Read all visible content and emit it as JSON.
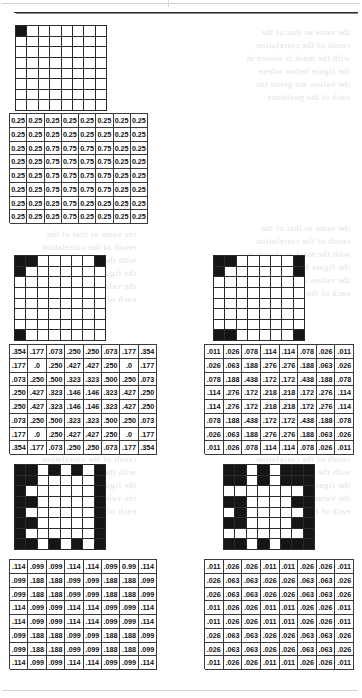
{
  "page": {
    "ghost_text_blocks": [
      "the same as that of the\nresult of the correlation\nwith the mask is shown in\nthe figure below where\nthe values are given for\neach of the positions"
    ]
  },
  "figures": [
    {
      "id": "figure-1",
      "name": "bitmap-1",
      "rows": 8,
      "cols": 8,
      "description": "single black cell at top-left corner",
      "cells": [
        [
          1,
          0,
          0,
          0,
          0,
          0,
          0,
          0
        ],
        [
          0,
          0,
          0,
          0,
          0,
          0,
          0,
          0
        ],
        [
          0,
          0,
          0,
          0,
          0,
          0,
          0,
          0
        ],
        [
          0,
          0,
          0,
          0,
          0,
          0,
          0,
          0
        ],
        [
          0,
          0,
          0,
          0,
          0,
          0,
          0,
          0
        ],
        [
          0,
          0,
          0,
          0,
          0,
          0,
          0,
          0
        ],
        [
          0,
          0,
          0,
          0,
          0,
          0,
          0,
          0
        ],
        [
          0,
          0,
          0,
          0,
          0,
          0,
          0,
          0
        ]
      ]
    },
    {
      "id": "figure-2",
      "name": "bitmap-2",
      "rows": 8,
      "cols": 8,
      "description": "black cells at three corners plus inner neighbours",
      "cells": [
        [
          1,
          1,
          0,
          0,
          0,
          0,
          0,
          1
        ],
        [
          1,
          0,
          0,
          0,
          0,
          0,
          0,
          0
        ],
        [
          0,
          0,
          0,
          0,
          0,
          0,
          0,
          0
        ],
        [
          0,
          0,
          0,
          0,
          0,
          0,
          0,
          0
        ],
        [
          0,
          0,
          0,
          0,
          0,
          0,
          0,
          0
        ],
        [
          0,
          0,
          0,
          0,
          0,
          0,
          0,
          0
        ],
        [
          0,
          0,
          0,
          0,
          0,
          0,
          0,
          0
        ],
        [
          1,
          0,
          0,
          0,
          0,
          0,
          0,
          0
        ]
      ]
    },
    {
      "id": "figure-3",
      "name": "bitmap-3",
      "rows": 8,
      "cols": 8,
      "description": "alternating black cells along top row and left column",
      "cells": [
        [
          1,
          1,
          0,
          1,
          0,
          1,
          0,
          1
        ],
        [
          1,
          1,
          0,
          0,
          0,
          0,
          0,
          1
        ],
        [
          1,
          0,
          0,
          0,
          0,
          0,
          0,
          1
        ],
        [
          1,
          1,
          0,
          0,
          0,
          0,
          0,
          1
        ],
        [
          1,
          0,
          0,
          0,
          0,
          0,
          0,
          1
        ],
        [
          1,
          1,
          0,
          0,
          0,
          0,
          0,
          1
        ],
        [
          1,
          0,
          0,
          0,
          0,
          0,
          0,
          1
        ],
        [
          1,
          1,
          0,
          1,
          0,
          1,
          0,
          1
        ]
      ]
    },
    {
      "id": "figure-4",
      "name": "bitmap-4",
      "rows": 8,
      "cols": 8,
      "description": "black blocks at top-left, top-right and bottom-left corners",
      "cells": [
        [
          1,
          1,
          0,
          0,
          0,
          0,
          0,
          1
        ],
        [
          1,
          0,
          0,
          0,
          0,
          0,
          0,
          1
        ],
        [
          0,
          0,
          0,
          0,
          0,
          0,
          0,
          0
        ],
        [
          0,
          0,
          0,
          0,
          0,
          0,
          0,
          0
        ],
        [
          0,
          0,
          0,
          0,
          0,
          0,
          0,
          0
        ],
        [
          0,
          0,
          0,
          0,
          0,
          0,
          0,
          0
        ],
        [
          0,
          0,
          0,
          0,
          0,
          0,
          0,
          0
        ],
        [
          1,
          1,
          0,
          0,
          0,
          0,
          0,
          1
        ]
      ]
    },
    {
      "id": "figure-5",
      "name": "bitmap-5",
      "rows": 8,
      "cols": 8,
      "description": "checkerboard-like border pattern",
      "cells": [
        [
          1,
          1,
          0,
          1,
          0,
          1,
          1,
          1
        ],
        [
          1,
          1,
          0,
          1,
          0,
          1,
          1,
          1
        ],
        [
          0,
          0,
          0,
          0,
          0,
          0,
          0,
          1
        ],
        [
          1,
          1,
          0,
          0,
          0,
          0,
          1,
          1
        ],
        [
          0,
          1,
          0,
          0,
          0,
          0,
          0,
          1
        ],
        [
          1,
          1,
          0,
          0,
          0,
          0,
          1,
          1
        ],
        [
          0,
          0,
          0,
          0,
          0,
          0,
          0,
          1
        ],
        [
          1,
          1,
          0,
          1,
          0,
          1,
          1,
          1
        ]
      ]
    }
  ],
  "matrices": [
    {
      "id": "matrix-1",
      "name": "coefficient-matrix-1",
      "rows": [
        [
          "0.25",
          "0.25",
          "0.25",
          "0.25",
          "0.25",
          "0.25",
          "0.25",
          "0.25"
        ],
        [
          "0.25",
          "0.25",
          "0.25",
          "0.25",
          "0.25",
          "0.25",
          "0.25",
          "0.25"
        ],
        [
          "0.25",
          "0.25",
          "0.75",
          "0.75",
          "0.75",
          "0.75",
          "0.25",
          "0.25"
        ],
        [
          "0.25",
          "0.25",
          "0.75",
          "0.75",
          "0.75",
          "0.75",
          "0.25",
          "0.25"
        ],
        [
          "0.25",
          "0.25",
          "0.75",
          "0.75",
          "0.75",
          "0.75",
          "0.25",
          "0.25"
        ],
        [
          "0.25",
          "0.25",
          "0.75",
          "0.75",
          "0.75",
          "0.75",
          "0.25",
          "0.25"
        ],
        [
          "0.25",
          "0.25",
          "0.25",
          "0.75",
          "0.25",
          "0.25",
          "0.25",
          "0.25"
        ],
        [
          "0.25",
          "0.25",
          "0.25",
          "0.75",
          "0.25",
          "0.25",
          "0.25",
          "0.25"
        ]
      ]
    },
    {
      "id": "matrix-2",
      "name": "coefficient-matrix-2",
      "rows": [
        [
          ".354",
          ".177",
          ".073",
          ".250",
          ".250",
          ".073",
          ".177",
          ".354"
        ],
        [
          ".177",
          ".0",
          ".250",
          ".427",
          ".427",
          ".250",
          ".0",
          ".177"
        ],
        [
          ".073",
          ".250",
          ".500",
          ".323",
          ".323",
          ".500",
          ".250",
          ".073"
        ],
        [
          ".250",
          ".427",
          ".323",
          ".146",
          ".146",
          ".323",
          ".427",
          ".250"
        ],
        [
          ".250",
          ".427",
          ".323",
          ".146",
          ".146",
          ".323",
          ".427",
          ".250"
        ],
        [
          ".073",
          ".250",
          ".500",
          ".323",
          ".323",
          ".500",
          ".250",
          ".073"
        ],
        [
          ".177",
          ".0",
          ".250",
          ".427",
          ".427",
          ".250",
          ".0",
          ".177"
        ],
        [
          ".354",
          ".177",
          ".073",
          ".250",
          ".250",
          ".073",
          ".177",
          ".354"
        ]
      ]
    },
    {
      "id": "matrix-3",
      "name": "coefficient-matrix-3",
      "rows": [
        [
          ".114",
          ".099",
          ".099",
          ".114",
          ".114",
          ".099",
          "0.99",
          ".114"
        ],
        [
          ".099",
          ".188",
          ".188",
          ".099",
          ".099",
          ".188",
          ".188",
          ".099"
        ],
        [
          ".099",
          ".188",
          ".188",
          ".099",
          ".099",
          ".188",
          ".188",
          ".099"
        ],
        [
          ".114",
          ".099",
          ".099",
          ".114",
          ".114",
          ".099",
          ".099",
          ".114"
        ],
        [
          ".114",
          ".099",
          ".099",
          ".114",
          ".114",
          ".099",
          ".099",
          ".114"
        ],
        [
          ".099",
          ".188",
          ".188",
          ".099",
          ".099",
          ".188",
          ".188",
          ".099"
        ],
        [
          ".099",
          ".188",
          ".188",
          ".099",
          ".099",
          ".188",
          ".188",
          ".099"
        ],
        [
          ".114",
          ".099",
          ".099",
          ".114",
          ".114",
          ".099",
          ".099",
          ".114"
        ]
      ]
    },
    {
      "id": "matrix-4",
      "name": "coefficient-matrix-4",
      "rows": [
        [
          ".011",
          ".026",
          ".078",
          ".114",
          ".114",
          ".078",
          ".026",
          ".011"
        ],
        [
          ".026",
          ".063",
          ".188",
          ".276",
          ".276",
          ".188",
          ".063",
          ".026"
        ],
        [
          ".078",
          ".188",
          ".438",
          ".172",
          ".172",
          ".438",
          ".188",
          ".078"
        ],
        [
          ".114",
          ".276",
          ".172",
          ".218",
          ".218",
          ".172",
          ".276",
          ".114"
        ],
        [
          ".114",
          ".276",
          ".172",
          ".218",
          ".218",
          ".172",
          ".276",
          ".114"
        ],
        [
          ".078",
          ".188",
          ".438",
          ".172",
          ".172",
          ".438",
          ".188",
          ".078"
        ],
        [
          ".026",
          ".063",
          ".188",
          ".276",
          ".276",
          ".188",
          ".063",
          ".026"
        ],
        [
          ".011",
          ".026",
          ".078",
          ".114",
          ".114",
          ".078",
          ".026",
          ".011"
        ]
      ]
    },
    {
      "id": "matrix-5",
      "name": "coefficient-matrix-5",
      "rows": [
        [
          ".011",
          ".026",
          ".026",
          ".011",
          ".011",
          ".026",
          ".026",
          ".011"
        ],
        [
          ".026",
          ".063",
          ".063",
          ".026",
          ".026",
          ".063",
          ".063",
          ".026"
        ],
        [
          ".026",
          ".063",
          ".063",
          ".026",
          ".026",
          ".063",
          ".063",
          ".026"
        ],
        [
          ".011",
          ".026",
          ".026",
          ".011",
          ".011",
          ".026",
          ".026",
          ".011"
        ],
        [
          ".011",
          ".026",
          ".026",
          ".011",
          ".011",
          ".026",
          ".026",
          ".011"
        ],
        [
          ".026",
          ".063",
          ".063",
          ".026",
          ".026",
          ".063",
          ".063",
          ".026"
        ],
        [
          ".026",
          ".063",
          ".063",
          ".026",
          ".026",
          ".063",
          ".063",
          ".026"
        ],
        [
          ".011",
          ".026",
          ".026",
          ".011",
          ".011",
          ".026",
          ".026",
          ".011"
        ]
      ]
    }
  ],
  "colors": {
    "ink": "#151515",
    "paper": "#ffffff",
    "grid_line": "#3a3a3a",
    "ghost": "#e2e2e2"
  }
}
